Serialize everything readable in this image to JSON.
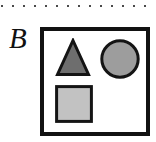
{
  "figure": {
    "panel_label": "B",
    "width": 156,
    "height": 142,
    "background_color": "#ffffff"
  },
  "top_rule": {
    "style": "dotted",
    "dot_color": "#4a4a4a",
    "dot_size_px": 2,
    "dot_spacing_px": 11,
    "dot_count": 14,
    "y_px": 7
  },
  "scene_box": {
    "border_color": "#121212",
    "border_width_px": 4,
    "fill_color": "#ffffff",
    "x_px": 40,
    "y_px": 27,
    "width_px": 110,
    "height_px": 109
  },
  "shapes": [
    {
      "name": "triangle",
      "kind": "triangle",
      "fill_color": "#6e6e6e",
      "stroke_color": "#141414",
      "stroke_width_px": 3,
      "x_px": 55,
      "y_px": 38,
      "width_px": 36,
      "height_px": 39
    },
    {
      "name": "circle",
      "kind": "circle",
      "fill_color": "#9d9d9d",
      "stroke_color": "#141414",
      "stroke_width_px": 3,
      "x_px": 100,
      "y_px": 39,
      "width_px": 40,
      "height_px": 40
    },
    {
      "name": "square",
      "kind": "square",
      "fill_color": "#c2c2c2",
      "stroke_color": "#141414",
      "stroke_width_px": 3,
      "x_px": 55,
      "y_px": 85,
      "width_px": 38,
      "height_px": 38
    }
  ]
}
